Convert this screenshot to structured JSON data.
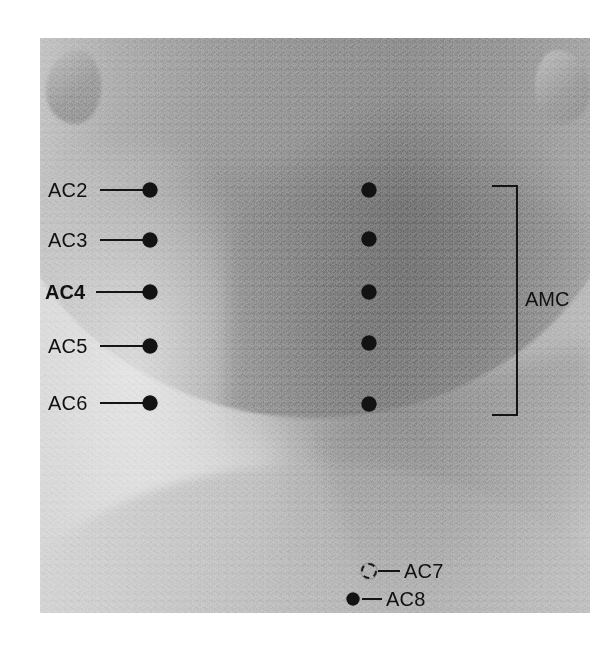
{
  "figure": {
    "background_color": "#ffffff",
    "ink_color": "#141414"
  },
  "photo": {
    "subject": "anterior-neck",
    "features": [
      "chin",
      "jawline",
      "left-ear",
      "right-ear",
      "neck",
      "sternocleidomastoid",
      "clavicle",
      "shoulders"
    ],
    "tone": "grayscale-halftone"
  },
  "bracket": {
    "label": "AMC",
    "orientation": "right-side-vertical"
  },
  "points": [
    {
      "id": "AC2",
      "label": "AC2",
      "bold": false,
      "marker": "filled-dot",
      "label_side": "left",
      "label_x": 48,
      "marker_x": 150,
      "marker_y": 190,
      "line_from": 100,
      "line_to": 143
    },
    {
      "id": "AC3",
      "label": "AC3",
      "bold": false,
      "marker": "filled-dot",
      "label_side": "left",
      "label_x": 48,
      "marker_x": 150,
      "marker_y": 240,
      "line_from": 100,
      "line_to": 143
    },
    {
      "id": "AC4",
      "label": "AC4",
      "bold": true,
      "marker": "filled-dot",
      "label_side": "left",
      "label_x": 45,
      "marker_x": 150,
      "marker_y": 292,
      "line_from": 96,
      "line_to": 143
    },
    {
      "id": "AC5",
      "label": "AC5",
      "bold": false,
      "marker": "filled-dot",
      "label_side": "left",
      "label_x": 48,
      "marker_x": 150,
      "marker_y": 346,
      "line_from": 100,
      "line_to": 143
    },
    {
      "id": "AC6",
      "label": "AC6",
      "bold": false,
      "marker": "filled-dot",
      "label_side": "left",
      "label_x": 48,
      "marker_x": 150,
      "marker_y": 403,
      "line_from": 100,
      "line_to": 143
    },
    {
      "id": "AC7",
      "label": "AC7",
      "bold": false,
      "marker": "dashed-circle",
      "label_side": "right",
      "label_x": 404,
      "marker_x": 369,
      "marker_y": 571,
      "line_from": 378,
      "line_to": 400
    },
    {
      "id": "AC8",
      "label": "AC8",
      "bold": false,
      "marker": "filled-dot",
      "label_side": "right",
      "label_x": 386,
      "marker_x": 353,
      "marker_y": 599,
      "line_from": 362,
      "line_to": 382
    }
  ],
  "midline_points": [
    {
      "id": "AC2-mid",
      "marker": "filled-dot",
      "marker_x": 369,
      "marker_y": 190
    },
    {
      "id": "AC3-mid",
      "marker": "filled-dot",
      "marker_x": 369,
      "marker_y": 239
    },
    {
      "id": "AC4-mid",
      "marker": "filled-dot",
      "marker_x": 369,
      "marker_y": 292
    },
    {
      "id": "AC5-mid",
      "marker": "filled-dot",
      "marker_x": 369,
      "marker_y": 343
    },
    {
      "id": "AC6-mid",
      "marker": "filled-dot",
      "marker_x": 369,
      "marker_y": 404
    }
  ]
}
